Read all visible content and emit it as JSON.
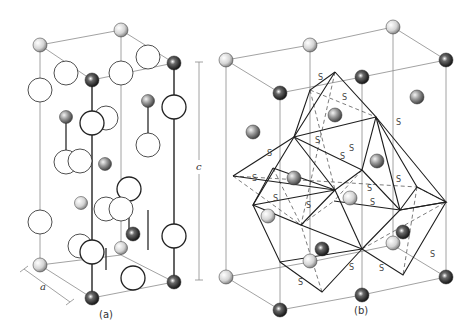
{
  "figure": {
    "panels": [
      {
        "id": "a",
        "caption": "(a)",
        "axis_label": "a",
        "cell": {
          "top": [
            [
              40,
              45
            ],
            [
              121,
              30
            ],
            [
              174,
              63
            ],
            [
              92,
              80
            ]
          ],
          "bottom": [
            [
              40,
              265
            ],
            [
              121,
              255
            ],
            [
              174,
              282
            ],
            [
              92,
              298
            ]
          ]
        },
        "bonds": [
          [
            92,
            80,
            92,
            298
          ],
          [
            174,
            63,
            174,
            282
          ],
          [
            66,
            115,
            66,
            165
          ],
          [
            148,
            100,
            148,
            150
          ],
          [
            129,
            183,
            129,
            235
          ],
          [
            148,
            210,
            148,
            250
          ],
          [
            106,
            248,
            106,
            270
          ]
        ],
        "open_circles": [
          {
            "x": 40,
            "y": 90,
            "r": 12,
            "w": 0.8
          },
          {
            "x": 66,
            "y": 73,
            "r": 12,
            "w": 0.8
          },
          {
            "x": 121,
            "y": 73,
            "r": 12,
            "w": 0.8
          },
          {
            "x": 148,
            "y": 57,
            "r": 12,
            "w": 0.8
          },
          {
            "x": 174,
            "y": 107,
            "r": 12,
            "w": 1.3
          },
          {
            "x": 106,
            "y": 118,
            "r": 12,
            "w": 0.8
          },
          {
            "x": 92,
            "y": 123,
            "r": 12,
            "w": 1.3
          },
          {
            "x": 148,
            "y": 145,
            "r": 12,
            "w": 0.8
          },
          {
            "x": 66,
            "y": 162,
            "r": 12,
            "w": 0.8
          },
          {
            "x": 80,
            "y": 161,
            "r": 12,
            "w": 0.8
          },
          {
            "x": 40,
            "y": 222,
            "r": 12,
            "w": 0.8
          },
          {
            "x": 106,
            "y": 209,
            "r": 12,
            "w": 0.8
          },
          {
            "x": 129,
            "y": 189,
            "r": 12,
            "w": 1.3
          },
          {
            "x": 121,
            "y": 209,
            "r": 12,
            "w": 0.8
          },
          {
            "x": 80,
            "y": 246,
            "r": 12,
            "w": 0.8
          },
          {
            "x": 92,
            "y": 252,
            "r": 12,
            "w": 1.3
          },
          {
            "x": 174,
            "y": 236,
            "r": 12,
            "w": 1.3
          },
          {
            "x": 133,
            "y": 278,
            "r": 12,
            "w": 1.3
          }
        ],
        "atoms": [
          {
            "x": 40,
            "y": 45,
            "r": 7,
            "shade": "light"
          },
          {
            "x": 121,
            "y": 30,
            "r": 7,
            "shade": "light"
          },
          {
            "x": 174,
            "y": 63,
            "r": 7,
            "shade": "dark"
          },
          {
            "x": 92,
            "y": 80,
            "r": 7,
            "shade": "dark"
          },
          {
            "x": 66,
            "y": 117,
            "r": 6.5,
            "shade": "mid"
          },
          {
            "x": 148,
            "y": 101,
            "r": 6.5,
            "shade": "mid"
          },
          {
            "x": 105,
            "y": 164,
            "r": 6.5,
            "shade": "mid"
          },
          {
            "x": 81,
            "y": 203,
            "r": 6.5,
            "shade": "light"
          },
          {
            "x": 106,
            "y": 328,
            "r": 0,
            "shade": "none"
          },
          {
            "x": 133,
            "y": 234,
            "r": 7,
            "shade": "dark"
          },
          {
            "x": 121,
            "y": 248,
            "r": 6.5,
            "shade": "light"
          },
          {
            "x": 40,
            "y": 265,
            "r": 7,
            "shade": "light"
          },
          {
            "x": 174,
            "y": 282,
            "r": 7,
            "shade": "dark"
          },
          {
            "x": 92,
            "y": 298,
            "r": 7,
            "shade": "dark"
          }
        ]
      },
      {
        "id": "b",
        "caption": "(b)",
        "cell": {
          "top": [
            [
              226,
              60
            ],
            [
              310,
              45
            ],
            [
              393,
              27
            ],
            [
              446,
              60
            ],
            [
              362,
              77
            ],
            [
              280,
              93
            ]
          ],
          "bottom": [
            [
              226,
              277
            ],
            [
              310,
              262
            ],
            [
              393,
              245
            ],
            [
              446,
              277
            ],
            [
              362,
              295
            ],
            [
              280,
              310
            ]
          ]
        },
        "atoms": [
          {
            "x": 226,
            "y": 60,
            "r": 7,
            "shade": "light"
          },
          {
            "x": 310,
            "y": 45,
            "r": 7,
            "shade": "light"
          },
          {
            "x": 393,
            "y": 27,
            "r": 7,
            "shade": "light"
          },
          {
            "x": 446,
            "y": 60,
            "r": 7,
            "shade": "dark"
          },
          {
            "x": 362,
            "y": 77,
            "r": 7,
            "shade": "dark"
          },
          {
            "x": 280,
            "y": 93,
            "r": 7,
            "shade": "dark"
          },
          {
            "x": 417,
            "y": 97,
            "r": 7,
            "shade": "mid"
          },
          {
            "x": 335,
            "y": 115,
            "r": 7,
            "shade": "mid"
          },
          {
            "x": 253,
            "y": 132,
            "r": 7,
            "shade": "mid"
          },
          {
            "x": 377,
            "y": 161,
            "r": 7,
            "shade": "mid"
          },
          {
            "x": 294,
            "y": 178,
            "r": 7,
            "shade": "mid"
          },
          {
            "x": 350,
            "y": 198,
            "r": 7,
            "shade": "light"
          },
          {
            "x": 268,
            "y": 216,
            "r": 7,
            "shade": "light"
          },
          {
            "x": 403,
            "y": 232,
            "r": 7,
            "shade": "dark"
          },
          {
            "x": 322,
            "y": 249,
            "r": 7,
            "shade": "dark"
          },
          {
            "x": 393,
            "y": 243,
            "r": 7,
            "shade": "light"
          },
          {
            "x": 310,
            "y": 261,
            "r": 7,
            "shade": "light"
          },
          {
            "x": 226,
            "y": 277,
            "r": 7,
            "shade": "light"
          },
          {
            "x": 446,
            "y": 277,
            "r": 7,
            "shade": "dark"
          },
          {
            "x": 362,
            "y": 295,
            "r": 7,
            "shade": "dark"
          },
          {
            "x": 280,
            "y": 310,
            "r": 7,
            "shade": "dark"
          }
        ],
        "octahedra_solid": [
          [
            [
              335,
              72
            ],
            [
              294,
              137
            ],
            [
              362,
              170
            ],
            [
              376,
              117
            ],
            [
              335,
              72
            ]
          ],
          [
            [
              335,
              72
            ],
            [
              310,
              90
            ],
            [
              294,
              137
            ]
          ],
          [
            [
              376,
              117
            ],
            [
              294,
              137
            ]
          ],
          [
            [
              294,
              137
            ],
            [
              335,
              190
            ],
            [
              362,
              170
            ]
          ],
          [
            [
              294,
              137
            ],
            [
              253,
              205
            ],
            [
              335,
              190
            ]
          ],
          [
            [
              253,
              205
            ],
            [
              301,
              225
            ],
            [
              335,
              190
            ]
          ],
          [
            [
              253,
              205
            ],
            [
              280,
              262
            ],
            [
              362,
              249
            ]
          ],
          [
            [
              280,
              262
            ],
            [
              322,
              292
            ],
            [
              362,
              249
            ]
          ],
          [
            [
              301,
              225
            ],
            [
              362,
              249
            ]
          ],
          [
            [
              335,
              190
            ],
            [
              362,
              249
            ]
          ],
          [
            [
              362,
              170
            ],
            [
              400,
              210
            ],
            [
              362,
              249
            ]
          ],
          [
            [
              376,
              117
            ],
            [
              400,
              210
            ]
          ],
          [
            [
              376,
              117
            ],
            [
              417,
              187
            ],
            [
              400,
              210
            ]
          ],
          [
            [
              417,
              187
            ],
            [
              446,
              202
            ],
            [
              400,
              210
            ]
          ],
          [
            [
              376,
              117
            ],
            [
              446,
              202
            ],
            [
              400,
              210
            ]
          ],
          [
            [
              362,
              249
            ],
            [
              403,
              275
            ],
            [
              446,
              202
            ]
          ],
          [
            [
              334,
              201
            ],
            [
              400,
              210
            ]
          ],
          [
            [
              253,
              205
            ],
            [
              273,
              168
            ]
          ],
          [
            [
              273,
              168
            ],
            [
              335,
              190
            ]
          ],
          [
            [
              233,
              176
            ],
            [
              294,
              137
            ]
          ],
          [
            [
              233,
              176
            ],
            [
              335,
              190
            ]
          ]
        ],
        "octahedra_dashed": [
          [
            [
              310,
              90
            ],
            [
              376,
              117
            ]
          ],
          [
            [
              310,
              90
            ],
            [
              335,
              190
            ]
          ],
          [
            [
              233,
              176
            ],
            [
              301,
              225
            ]
          ],
          [
            [
              233,
              176
            ],
            [
              417,
              187
            ]
          ],
          [
            [
              362,
              170
            ],
            [
              334,
              201
            ]
          ],
          [
            [
              417,
              187
            ],
            [
              403,
              275
            ]
          ],
          [
            [
              301,
              225
            ],
            [
              334,
              201
            ]
          ],
          [
            [
              273,
              168
            ],
            [
              301,
              225
            ]
          ],
          [
            [
              322,
              292
            ],
            [
              301,
              225
            ]
          ],
          [
            [
              446,
              202
            ],
            [
              417,
              187
            ]
          ],
          [
            [
              335,
              72
            ],
            [
              301,
              225
            ]
          ],
          [
            [
              362,
              249
            ],
            [
              446,
              202
            ]
          ]
        ],
        "s_labels": [
          {
            "x": 318,
            "y": 80,
            "t": "S"
          },
          {
            "x": 342,
            "y": 100,
            "t": "S"
          },
          {
            "x": 396,
            "y": 125,
            "t": "S"
          },
          {
            "x": 315,
            "y": 143,
            "t": "S"
          },
          {
            "x": 267,
            "y": 156,
            "t": "S"
          },
          {
            "x": 252,
            "y": 181,
            "t": "S"
          },
          {
            "x": 349,
            "y": 151,
            "t": "S"
          },
          {
            "x": 340,
            "y": 159,
            "t": "S"
          },
          {
            "x": 273,
            "y": 201,
            "t": "S"
          },
          {
            "x": 306,
            "y": 208,
            "t": "S"
          },
          {
            "x": 367,
            "y": 191,
            "t": "S"
          },
          {
            "x": 370,
            "y": 205,
            "t": "S"
          },
          {
            "x": 349,
            "y": 270,
            "t": "S"
          },
          {
            "x": 298,
            "y": 285,
            "t": "S"
          },
          {
            "x": 379,
            "y": 271,
            "t": "S"
          },
          {
            "x": 430,
            "y": 257,
            "t": "S"
          },
          {
            "x": 396,
            "y": 182,
            "t": "S"
          }
        ]
      }
    ],
    "c_axis": {
      "label": "c",
      "x": 199,
      "y_top": 62,
      "y_bottom": 280
    }
  },
  "labels": {
    "caption_a": "(a)",
    "caption_b": "(b)",
    "axis_a": "a",
    "axis_c": "c",
    "atom_label": "S"
  }
}
